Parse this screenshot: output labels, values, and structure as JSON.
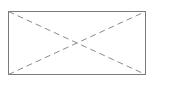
{
  "diagram": {
    "type": "image-placeholder",
    "shape": "rectangle-with-diagonal-cross",
    "rect": {
      "x": 8.5,
      "y": 11.5,
      "width": 137,
      "height": 63
    },
    "border_color": "#7a7a7a",
    "diagonal_color": "#8a8a8a",
    "diagonal_dash": "6,4"
  }
}
